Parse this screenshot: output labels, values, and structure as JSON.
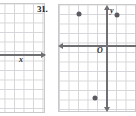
{
  "page": {
    "width": 136,
    "height": 116,
    "background": "#ffffff"
  },
  "colors": {
    "grid_line": "#d6d6da",
    "panel_border": "#c9c9cc",
    "axis": "#6e6e73",
    "point": "#5a5a60",
    "text": "#1c1c1e"
  },
  "problem": {
    "number_label": "31."
  },
  "figures": {
    "left_partial": {
      "name": "partial-coordinate-grid",
      "x_axis_label": "x",
      "grid_spacing_px": 9.5,
      "note_visible": "cropped grid showing only the x-axis and its label"
    },
    "right_main": {
      "name": "coordinate-grid",
      "x_axis_label": "x",
      "y_axis_label": "y",
      "origin_label": "O",
      "grid_spacing_px": 9.5
    }
  },
  "chart_data": {
    "type": "scatter",
    "title": "31.",
    "xlabel": "x",
    "ylabel": "y",
    "grid": true,
    "legend": false,
    "axis_arrows": [
      "left",
      "right",
      "up",
      "down"
    ],
    "origin_label": "O",
    "xlim": [
      -5,
      3
    ],
    "ylim": [
      -5,
      4
    ],
    "x": [
      -3,
      1,
      -1
    ],
    "y": [
      3,
      3,
      -5
    ],
    "points": [
      {
        "label": "",
        "x": -3,
        "y": 3,
        "px": 79,
        "py": 14
      },
      {
        "label": "",
        "x": 1,
        "y": 3,
        "px": 117,
        "py": 15
      },
      {
        "label": "",
        "x": -1,
        "y": -5,
        "px": 95,
        "py": 98
      }
    ]
  }
}
